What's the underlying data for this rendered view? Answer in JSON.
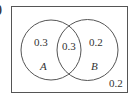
{
  "diagram": {
    "part_label": ")",
    "type": "venn",
    "universe_box": {
      "stroke": "#555555"
    },
    "sets": [
      {
        "name": "A",
        "only_value": "0.3"
      },
      {
        "name": "B",
        "only_value": "0.2"
      }
    ],
    "intersection_value": "0.3",
    "outside_value": "0.2"
  }
}
